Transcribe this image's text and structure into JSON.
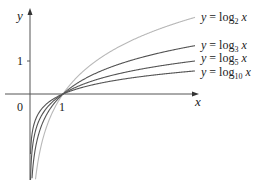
{
  "chart_data": {
    "type": "line",
    "title": "",
    "xlabel": "x",
    "ylabel": "y",
    "x_ticks": [
      {
        "value": 0,
        "label": "0"
      },
      {
        "value": 1,
        "label": "1"
      }
    ],
    "y_ticks": [
      {
        "value": 1,
        "label": "1"
      }
    ],
    "xlim": [
      0,
      5.1
    ],
    "ylim": [
      -2.6,
      2.8
    ],
    "grid": false,
    "legend_position": "inline-right",
    "series": [
      {
        "name": "y = log_2 x",
        "base": 2,
        "color": "#b8b8b8",
        "x": [
          0.02,
          0.1,
          0.25,
          0.5,
          1,
          2,
          3,
          4,
          5
        ],
        "values": [
          -5.64,
          -3.32,
          -2.0,
          -1.0,
          0,
          1.0,
          1.58,
          2.0,
          2.32
        ]
      },
      {
        "name": "y = log_3 x",
        "base": 3,
        "color": "#555555",
        "x": [
          0.02,
          0.1,
          0.25,
          0.5,
          1,
          2,
          3,
          4,
          5
        ],
        "values": [
          -3.56,
          -2.1,
          -1.26,
          -0.63,
          0,
          0.63,
          1.0,
          1.26,
          1.46
        ]
      },
      {
        "name": "y = log_5 x",
        "base": 5,
        "color": "#555555",
        "x": [
          0.02,
          0.1,
          0.25,
          0.5,
          1,
          2,
          3,
          4,
          5
        ],
        "values": [
          -2.43,
          -1.43,
          -0.86,
          -0.43,
          0,
          0.43,
          0.68,
          0.86,
          1.0
        ]
      },
      {
        "name": "y = log_10 x",
        "base": 10,
        "color": "#555555",
        "x": [
          0.02,
          0.1,
          0.25,
          0.5,
          1,
          2,
          3,
          4,
          5
        ],
        "values": [
          -1.7,
          -1.0,
          -0.6,
          -0.3,
          0,
          0.3,
          0.48,
          0.6,
          0.7
        ]
      }
    ],
    "annotations": [
      "y = log₂ x",
      "y = log₃ x",
      "y = log₅ x",
      "y = log₁₀ x"
    ]
  },
  "axes": {
    "x_label": "x",
    "y_label": "y",
    "origin_label": "0",
    "x_tick_1": "1",
    "y_tick_1": "1"
  },
  "legend": {
    "log2": {
      "prefix": "y = log",
      "sub": "2",
      "suffix": " x"
    },
    "log3": {
      "prefix": "y = log",
      "sub": "3",
      "suffix": " x"
    },
    "log5": {
      "prefix": "y = log",
      "sub": "5",
      "suffix": " x"
    },
    "log10": {
      "prefix": "y = log",
      "sub": "10",
      "suffix": " x"
    }
  }
}
